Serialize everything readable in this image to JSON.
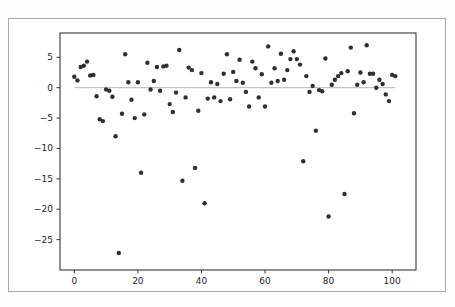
{
  "figure": {
    "background": "#ffffff",
    "frame_border_color": "#a9a9a9"
  },
  "chart_data": {
    "type": "scatter",
    "title": "",
    "xlabel": "",
    "ylabel": "",
    "grid": false,
    "legend": null,
    "xlim": [
      -4.5,
      107.5
    ],
    "ylim": [
      -30,
      9
    ],
    "x_ticks": [
      {
        "v": 0,
        "label": "0"
      },
      {
        "v": 20,
        "label": "20"
      },
      {
        "v": 40,
        "label": "40"
      },
      {
        "v": 60,
        "label": "60"
      },
      {
        "v": 80,
        "label": "80"
      },
      {
        "v": 100,
        "label": "100"
      }
    ],
    "y_ticks": [
      {
        "v": 5,
        "label": "5"
      },
      {
        "v": 0,
        "label": "0"
      },
      {
        "v": -5,
        "label": "−5"
      },
      {
        "v": -10,
        "label": "−10"
      },
      {
        "v": -15,
        "label": "−15"
      },
      {
        "v": -20,
        "label": "−20"
      },
      {
        "v": -25,
        "label": "−25"
      }
    ],
    "zero_line": {
      "y": 0,
      "x_start": 0,
      "x_end": 101,
      "color": "#b4b4b4"
    },
    "marker": {
      "color": "#2f2f2f",
      "radius": 2.2
    },
    "axis_color": "#222222",
    "tick_label_color": "#262626",
    "points": [
      [
        0,
        1.8
      ],
      [
        1,
        1.2
      ],
      [
        2,
        3.4
      ],
      [
        3,
        3.6
      ],
      [
        4,
        4.3
      ],
      [
        5,
        2.0
      ],
      [
        6,
        2.1
      ],
      [
        7,
        -1.4
      ],
      [
        8,
        -5.2
      ],
      [
        9,
        -5.5
      ],
      [
        10,
        -0.3
      ],
      [
        11,
        -0.5
      ],
      [
        12,
        -1.5
      ],
      [
        13,
        -8.0
      ],
      [
        14,
        -27.2
      ],
      [
        15,
        -4.3
      ],
      [
        16,
        5.5
      ],
      [
        17,
        0.9
      ],
      [
        18,
        -2.0
      ],
      [
        19,
        -5.0
      ],
      [
        20,
        0.9
      ],
      [
        21,
        -14.0
      ],
      [
        22,
        -4.4
      ],
      [
        23,
        4.1
      ],
      [
        24,
        -0.3
      ],
      [
        25,
        1.1
      ],
      [
        26,
        3.4
      ],
      [
        27,
        -0.5
      ],
      [
        28,
        3.5
      ],
      [
        29,
        3.6
      ],
      [
        30,
        -2.7
      ],
      [
        31,
        -4.0
      ],
      [
        32,
        -0.8
      ],
      [
        33,
        6.2
      ],
      [
        34,
        -15.3
      ],
      [
        35,
        -1.6
      ],
      [
        36,
        3.3
      ],
      [
        37,
        2.9
      ],
      [
        38,
        -13.2
      ],
      [
        39,
        -3.8
      ],
      [
        40,
        2.4
      ],
      [
        41,
        -19.0
      ],
      [
        42,
        -1.8
      ],
      [
        43,
        0.9
      ],
      [
        44,
        -1.6
      ],
      [
        45,
        0.6
      ],
      [
        46,
        -2.2
      ],
      [
        47,
        2.3
      ],
      [
        48,
        5.5
      ],
      [
        49,
        -1.9
      ],
      [
        50,
        2.6
      ],
      [
        51,
        1.1
      ],
      [
        52,
        4.6
      ],
      [
        53,
        0.8
      ],
      [
        54,
        -0.7
      ],
      [
        55,
        -3.1
      ],
      [
        56,
        4.3
      ],
      [
        57,
        3.2
      ],
      [
        58,
        -1.6
      ],
      [
        59,
        2.2
      ],
      [
        60,
        -3.1
      ],
      [
        61,
        6.8
      ],
      [
        62,
        0.8
      ],
      [
        63,
        3.2
      ],
      [
        64,
        1.1
      ],
      [
        65,
        5.6
      ],
      [
        66,
        1.3
      ],
      [
        67,
        2.9
      ],
      [
        68,
        4.7
      ],
      [
        69,
        6.0
      ],
      [
        70,
        4.7
      ],
      [
        71,
        3.8
      ],
      [
        72,
        -12.1
      ],
      [
        73,
        1.9
      ],
      [
        74,
        -0.7
      ],
      [
        75,
        0.3
      ],
      [
        76,
        -7.1
      ],
      [
        77,
        -0.4
      ],
      [
        78,
        -0.6
      ],
      [
        79,
        4.8
      ],
      [
        80,
        -21.2
      ],
      [
        81,
        0.5
      ],
      [
        82,
        1.3
      ],
      [
        83,
        1.9
      ],
      [
        84,
        2.4
      ],
      [
        85,
        -17.5
      ],
      [
        86,
        2.7
      ],
      [
        87,
        6.6
      ],
      [
        88,
        -4.2
      ],
      [
        89,
        0.5
      ],
      [
        90,
        2.5
      ],
      [
        91,
        0.9
      ],
      [
        92,
        7.0
      ],
      [
        93,
        2.3
      ],
      [
        94,
        2.3
      ],
      [
        95,
        0.0
      ],
      [
        96,
        1.3
      ],
      [
        97,
        0.6
      ],
      [
        98,
        -1.1
      ],
      [
        99,
        -2.2
      ],
      [
        100,
        2.1
      ],
      [
        101,
        1.9
      ]
    ]
  }
}
